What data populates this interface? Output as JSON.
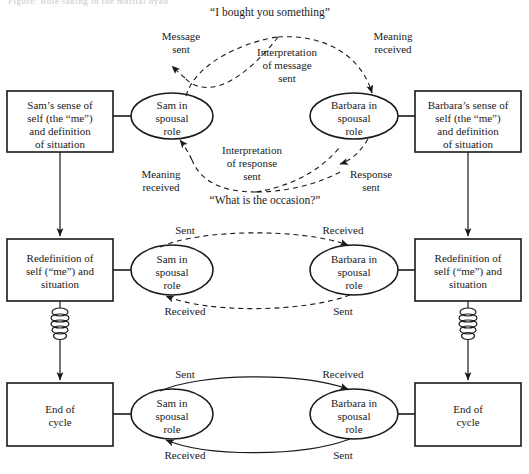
{
  "diagram": {
    "title_cutoff": "Figure: Role-taking in the marital dyad",
    "quotes": {
      "opening": "“I bought you something”",
      "response": "“What is the occasion?”"
    },
    "rows": [
      {
        "id": "row-1",
        "left_box": "Sam’s sense of\nself (the “me”)\nand definition\nof situation",
        "left_ellipse": "Sam in\nspousal\nrole",
        "right_ellipse": "Barbara in\nspousal\nrole",
        "right_box": "Barbara’s sense of\nself (the “me”)\nand definition\nof situation",
        "annotations": {
          "message_sent": "Message\nsent",
          "interpretation_of_message_sent": "Interpretation\nof message\nsent",
          "meaning_received": "Meaning\nreceived",
          "meaning_received_2": "Meaning\nreceived",
          "interpretation_of_response_sent": "Interpretation\nof response\nsent",
          "response_sent": "Response\nsent"
        }
      },
      {
        "id": "row-2",
        "left_box": "Redefinition of\nself (“me”) and\nsituation",
        "left_ellipse": "Sam in\nspousal\nrole",
        "right_ellipse": "Barbara in\nspousal\nrole",
        "right_box": "Redefinition of\nself (“me”) and\nsituation",
        "annotations": {
          "top_left": "Sent",
          "top_right": "Received",
          "bottom_left": "Received",
          "bottom_right": "Sent"
        }
      },
      {
        "id": "row-3",
        "left_box": "End of\ncycle",
        "left_ellipse": "Sam in\nspousal\nrole",
        "right_ellipse": "Barbara in\nspousal\nrole",
        "right_box": "End of\ncycle",
        "annotations": {
          "top_left": "Sent",
          "top_right": "Received",
          "bottom_left": "Received",
          "bottom_right": "Sent"
        }
      }
    ],
    "colors": {
      "stroke": "#1a1a1a",
      "background": "#ffffff",
      "text": "#1a1a1a"
    }
  }
}
